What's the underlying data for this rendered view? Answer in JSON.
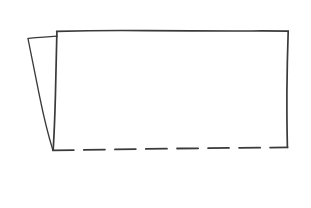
{
  "canvas": {
    "width": 311,
    "height": 208,
    "background_color": "#ffffff",
    "title": "Hand-drawn rectangle with side flap"
  },
  "style": {
    "stroke_color": "#3a3a3a",
    "stroke_width": 1.6,
    "flap_stroke_width": 1.3,
    "dash_pattern": "21 10",
    "line_style_solid": "solid",
    "line_style_dashed": "dashed"
  },
  "chart_data": {
    "type": "diagram",
    "shapes": [
      {
        "name": "main-rectangle",
        "description": "Large rectangle, solid top/left/right edges, dashed bottom edge",
        "corners": {
          "top_left": [
            57,
            31
          ],
          "top_right": [
            288,
            31
          ],
          "bottom_right": [
            288,
            147
          ],
          "bottom_left": [
            53,
            150
          ]
        },
        "edges": [
          {
            "name": "top-edge",
            "from": [
              57,
              31
            ],
            "to": [
              288,
              31
            ],
            "style": "solid"
          },
          {
            "name": "right-edge",
            "from": [
              288,
              31
            ],
            "to": [
              288,
              147
            ],
            "style": "solid"
          },
          {
            "name": "bottom-edge",
            "from": [
              288,
              147
            ],
            "to": [
              53,
              150
            ],
            "style": "dashed"
          },
          {
            "name": "left-edge",
            "from": [
              57,
              31
            ],
            "to": [
              53,
              150
            ],
            "style": "solid"
          }
        ]
      },
      {
        "name": "left-flap",
        "description": "Narrow tapered wedge on the left, like a folded page edge",
        "corners": {
          "top_left": [
            28,
            38
          ],
          "top_right": [
            57,
            36
          ],
          "bottom_point": [
            53,
            150
          ]
        },
        "edges": [
          {
            "name": "flap-top-edge",
            "from": [
              28,
              38
            ],
            "to": [
              57,
              36
            ],
            "style": "solid"
          },
          {
            "name": "flap-diagonal-edge",
            "from": [
              28,
              38
            ],
            "to": [
              53,
              150
            ],
            "style": "solid"
          }
        ]
      }
    ],
    "annotations": [],
    "labels": []
  }
}
